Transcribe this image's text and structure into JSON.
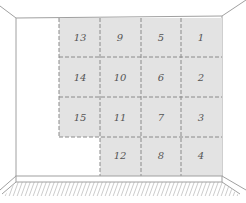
{
  "diagram": {
    "colors": {
      "panel_fill": "#e3e3e3",
      "panel_dash": "#8a8a8a",
      "wall_line": "#a0a0a0",
      "floor_hatch": "#9a9a9a",
      "number_text": "#555555"
    },
    "panels": [
      {
        "label": "13",
        "col": 0,
        "row": 0
      },
      {
        "label": "9",
        "col": 1,
        "row": 0
      },
      {
        "label": "5",
        "col": 2,
        "row": 0
      },
      {
        "label": "1",
        "col": 3,
        "row": 0
      },
      {
        "label": "14",
        "col": 0,
        "row": 1
      },
      {
        "label": "10",
        "col": 1,
        "row": 1
      },
      {
        "label": "6",
        "col": 2,
        "row": 1
      },
      {
        "label": "2",
        "col": 3,
        "row": 1
      },
      {
        "label": "15",
        "col": 0,
        "row": 2
      },
      {
        "label": "11",
        "col": 1,
        "row": 2
      },
      {
        "label": "7",
        "col": 2,
        "row": 2
      },
      {
        "label": "3",
        "col": 3,
        "row": 2
      },
      {
        "label": "12",
        "col": 1,
        "row": 3
      },
      {
        "label": "8",
        "col": 2,
        "row": 3
      },
      {
        "label": "4",
        "col": 3,
        "row": 3
      }
    ]
  }
}
